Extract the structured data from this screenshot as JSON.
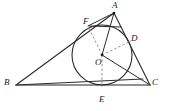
{
  "figure": {
    "colors": {
      "stroke": "#2b2b2b",
      "dashed": "#8a8a8a",
      "base_line": "#6e6e6e",
      "background": "#ffffff",
      "label": "#1a1a1a"
    },
    "points": [
      {
        "name": "A",
        "label": "A",
        "x": 114,
        "y": 13,
        "label_x": 112,
        "label_y": 1,
        "role": "triangle-vertex"
      },
      {
        "name": "B",
        "label": "B",
        "x": 16,
        "y": 85,
        "label_x": 4,
        "label_y": 78,
        "role": "triangle-vertex"
      },
      {
        "name": "C",
        "label": "C",
        "x": 150,
        "y": 85,
        "label_x": 152,
        "label_y": 78,
        "role": "triangle-vertex"
      },
      {
        "name": "O",
        "label": "O",
        "x": 102,
        "y": 55,
        "label_x": 95,
        "label_y": 58,
        "role": "incenter"
      },
      {
        "name": "D",
        "label": "D",
        "x": 128,
        "y": 46,
        "label_x": 131,
        "label_y": 34,
        "role": "tangent-point-ac"
      },
      {
        "name": "E",
        "label": "E",
        "x": 102,
        "y": 85,
        "label_x": 99,
        "label_y": 95,
        "role": "tangent-point-bc"
      },
      {
        "name": "F",
        "label": "F",
        "x": 91,
        "y": 28,
        "label_x": 83,
        "label_y": 17,
        "role": "tangent-point-ab"
      }
    ],
    "incircle": {
      "cx": 102,
      "cy": 55,
      "r": 30
    },
    "segments": [
      {
        "name": "side-ab",
        "from": "A",
        "to": "B",
        "style": "solid"
      },
      {
        "name": "side-bc",
        "from": "B",
        "to": "C",
        "style": "solid"
      },
      {
        "name": "side-ca",
        "from": "C",
        "to": "A",
        "style": "solid"
      },
      {
        "name": "cevian-a-e",
        "from": "A",
        "to": "O",
        "style": "solid"
      },
      {
        "name": "cevian-b-c",
        "from": "B",
        "to": "C",
        "style": "solid"
      },
      {
        "name": "cevian-c-o",
        "from": "C",
        "to": "O",
        "style": "solid"
      },
      {
        "name": "chord-f-right",
        "from": "F",
        "to": "A",
        "style": "solid"
      },
      {
        "name": "radius-o-f",
        "from": "O",
        "to": "F",
        "style": "dashed"
      },
      {
        "name": "radius-o-d",
        "from": "O",
        "to": "D",
        "style": "dashed"
      },
      {
        "name": "radius-o-e",
        "from": "O",
        "to": "E",
        "style": "dashed"
      }
    ]
  }
}
